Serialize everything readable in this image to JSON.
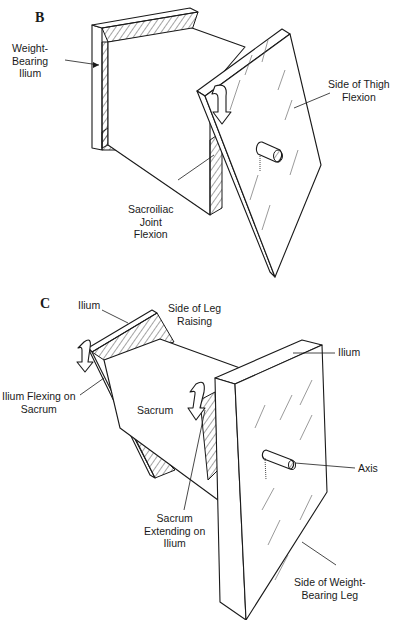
{
  "figure": {
    "panel_b": {
      "letter": "B",
      "labels": {
        "weight_bearing_ilium": [
          "Weight-",
          "Bearing",
          "Ilium"
        ],
        "side_of_thigh_flexion": [
          "Side of Thigh",
          "Flexion"
        ],
        "sacroiliac_joint_flexion": [
          "Sacroiliac",
          "Joint",
          "Flexion"
        ]
      }
    },
    "panel_c": {
      "letter": "C",
      "labels": {
        "ilium_top": "Ilium",
        "side_of_leg_raising": [
          "Side of Leg",
          "Raising"
        ],
        "ilium_right": "Ilium",
        "ilium_flexing_on_sacrum": [
          "Ilium Flexing on",
          "Sacrum"
        ],
        "sacrum": "Sacrum",
        "axis": "Axis",
        "sacrum_extending_on_ilium": [
          "Sacrum",
          "Extending on",
          "Ilium"
        ],
        "side_of_weight_bearing_leg": [
          "Side of Weight-",
          "Bearing Leg"
        ]
      }
    },
    "colors": {
      "ink": "#1a1a1a",
      "background": "#ffffff"
    }
  }
}
